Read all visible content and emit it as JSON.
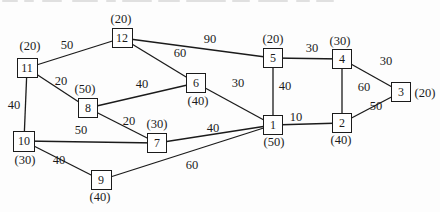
{
  "figure": {
    "type": "weighted-graph-diagram",
    "paper_color": "#fdfdfd",
    "ink_color": "#1b1b1b",
    "artifact_color": "#c9c9c9"
  },
  "nodes": [
    {
      "id": "1",
      "value": "(50)",
      "x": 273,
      "y": 125,
      "w": 20,
      "h": 20,
      "value_x": 274,
      "value_y": 142
    },
    {
      "id": "2",
      "value": "(40)",
      "x": 342,
      "y": 123,
      "w": 20,
      "h": 20,
      "value_x": 341,
      "value_y": 140
    },
    {
      "id": "3",
      "value": "(20)",
      "x": 401,
      "y": 92,
      "w": 20,
      "h": 20,
      "value_x": 425,
      "value_y": 93
    },
    {
      "id": "4",
      "value": "(30)",
      "x": 342,
      "y": 59,
      "w": 20,
      "h": 20,
      "value_x": 340,
      "value_y": 41
    },
    {
      "id": "5",
      "value": "(20)",
      "x": 273,
      "y": 58,
      "w": 20,
      "h": 20,
      "value_x": 273,
      "value_y": 39
    },
    {
      "id": "6",
      "value": "(40)",
      "x": 196,
      "y": 83,
      "w": 20,
      "h": 20,
      "value_x": 198,
      "value_y": 101
    },
    {
      "id": "7",
      "value": "(30)",
      "x": 157,
      "y": 143,
      "w": 20,
      "h": 20,
      "value_x": 157,
      "value_y": 124
    },
    {
      "id": "8",
      "value": "(50)",
      "x": 88,
      "y": 108,
      "w": 20,
      "h": 20,
      "value_x": 85,
      "value_y": 89
    },
    {
      "id": "9",
      "value": "(40)",
      "x": 101,
      "y": 180,
      "w": 21,
      "h": 20,
      "value_x": 100,
      "value_y": 197
    },
    {
      "id": "10",
      "value": "(30)",
      "x": 24,
      "y": 141,
      "w": 22,
      "h": 21,
      "value_x": 25,
      "value_y": 160
    },
    {
      "id": "11",
      "value": "(20)",
      "x": 27,
      "y": 68,
      "w": 21,
      "h": 20,
      "value_x": 30,
      "value_y": 46
    },
    {
      "id": "12",
      "value": "(20)",
      "x": 122,
      "y": 38,
      "w": 21,
      "h": 20,
      "value_x": 121,
      "value_y": 19
    }
  ],
  "edges": [
    {
      "from": "11",
      "to": "12",
      "weight": "50",
      "label_x": 67,
      "label_y": 45
    },
    {
      "from": "12",
      "to": "5",
      "weight": "90",
      "label_x": 210,
      "label_y": 39
    },
    {
      "from": "12",
      "to": "6",
      "weight": "60",
      "label_x": 180,
      "label_y": 53
    },
    {
      "from": "5",
      "to": "4",
      "weight": "30",
      "label_x": 312,
      "label_y": 48
    },
    {
      "from": "4",
      "to": "3",
      "weight": "30",
      "label_x": 386,
      "label_y": 61
    },
    {
      "from": "5",
      "to": "1",
      "weight": "40",
      "label_x": 285,
      "label_y": 86
    },
    {
      "from": "4",
      "to": "2",
      "weight": "60",
      "label_x": 364,
      "label_y": 87
    },
    {
      "from": "2",
      "to": "3",
      "weight": "50",
      "label_x": 376,
      "label_y": 106
    },
    {
      "from": "1",
      "to": "2",
      "weight": "10",
      "label_x": 296,
      "label_y": 117
    },
    {
      "from": "6",
      "to": "1",
      "weight": "30",
      "label_x": 238,
      "label_y": 83
    },
    {
      "from": "8",
      "to": "6",
      "weight": "40",
      "label_x": 142,
      "label_y": 84
    },
    {
      "from": "11",
      "to": "8",
      "weight": "20",
      "label_x": 61,
      "label_y": 81
    },
    {
      "from": "8",
      "to": "7",
      "weight": "20",
      "label_x": 129,
      "label_y": 121
    },
    {
      "from": "11",
      "to": "10",
      "weight": "40",
      "label_x": 14,
      "label_y": 105
    },
    {
      "from": "10",
      "to": "7",
      "weight": "50",
      "label_x": 81,
      "label_y": 130
    },
    {
      "from": "7",
      "to": "1",
      "weight": "40",
      "label_x": 213,
      "label_y": 128
    },
    {
      "from": "10",
      "to": "9",
      "weight": "40",
      "label_x": 59,
      "label_y": 160
    },
    {
      "from": "9",
      "to": "1",
      "weight": "60",
      "label_x": 192,
      "label_y": 165
    }
  ],
  "scan_artifacts": {
    "dashes": [
      {
        "x": 2,
        "w": 16
      },
      {
        "x": 24,
        "w": 10
      },
      {
        "x": 42,
        "w": 20
      },
      {
        "x": 72,
        "w": 26
      },
      {
        "x": 106,
        "w": 10
      },
      {
        "x": 122,
        "w": 30
      },
      {
        "x": 158,
        "w": 22
      },
      {
        "x": 186,
        "w": 40
      },
      {
        "x": 232,
        "w": 18
      },
      {
        "x": 258,
        "w": 30
      },
      {
        "x": 296,
        "w": 14
      },
      {
        "x": 316,
        "w": 18
      }
    ]
  }
}
